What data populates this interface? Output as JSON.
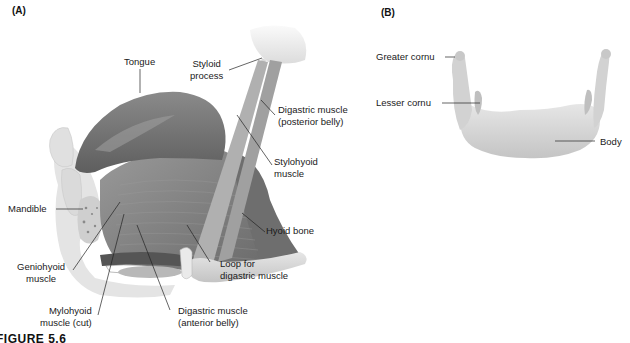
{
  "figure": {
    "caption": "FIGURE 5.6",
    "colors": {
      "muscle": "#7d7d7d",
      "muscle_dark": "#5f5f5f",
      "bone": "#d6d6d6",
      "bone_light": "#ececec",
      "leader_line": "#222222"
    }
  },
  "panel_a": {
    "label": "(A)",
    "labels": {
      "tongue": "Tongue",
      "styloid_1": "Styloid",
      "styloid_2": "process",
      "digastric_post_1": "Digastric muscle",
      "digastric_post_2": "(posterior belly)",
      "stylohyoid_1": "Stylohyoid",
      "stylohyoid_2": "muscle",
      "mandible": "Mandible",
      "hyoid_bone": "Hyoid bone",
      "geniohyoid_1": "Geniohyoid",
      "geniohyoid_2": "muscle",
      "loop_1": "Loop for",
      "loop_2": "digastric muscle",
      "mylohyoid_1": "Mylohyoid",
      "mylohyoid_2": "muscle (cut)",
      "digastric_ant_1": "Digastric muscle",
      "digastric_ant_2": "(anterior belly)"
    }
  },
  "panel_b": {
    "label": "(B)",
    "labels": {
      "greater_cornu": "Greater cornu",
      "lesser_cornu": "Lesser cornu",
      "body": "Body"
    }
  }
}
